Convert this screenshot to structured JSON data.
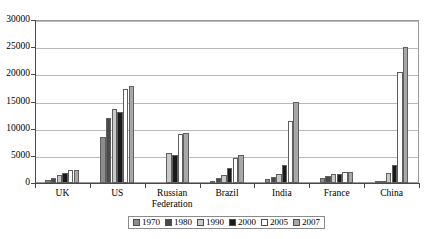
{
  "chart_data": {
    "type": "bar",
    "title": "",
    "subtitle": "",
    "xlabel": "",
    "ylabel": "",
    "ylim": [
      0,
      30000
    ],
    "ytick_step": 5000,
    "yticks": [
      "0",
      "5000",
      "10000",
      "15000",
      "20000",
      "25000",
      "30000"
    ],
    "grid": true,
    "legend_position": "bottom",
    "categories": [
      "UK",
      "US",
      "Russian Federation",
      "Brazil",
      "India",
      "France",
      "China"
    ],
    "series": [
      {
        "name": "1970",
        "color": "#8c8c8c",
        "values": [
          600,
          8500,
          null,
          400,
          700,
          900,
          300
        ]
      },
      {
        "name": "1980",
        "color": "#4a4a4a",
        "values": [
          950,
          12000,
          null,
          900,
          1100,
          1350,
          450
        ]
      },
      {
        "name": "1990",
        "color": "#c9c9c9",
        "values": [
          1450,
          13700,
          5500,
          1500,
          1750,
          1600,
          1900
        ]
      },
      {
        "name": "2000",
        "color": "#1a1a1a",
        "values": [
          1800,
          13000,
          5150,
          2700,
          3250,
          1750,
          3300
        ]
      },
      {
        "name": "2005",
        "color": "#ffffff",
        "values": [
          2350,
          17300,
          8950,
          4600,
          11500,
          2000,
          20500
        ]
      },
      {
        "name": "2007",
        "color": "#a8a8a8",
        "values": [
          2350,
          17800,
          9250,
          5100,
          14900,
          2050,
          25100
        ]
      }
    ]
  },
  "legend": {
    "items": [
      {
        "label": "1970"
      },
      {
        "label": "1980"
      },
      {
        "label": "1990"
      },
      {
        "label": "2000"
      },
      {
        "label": "2005"
      },
      {
        "label": "2007"
      }
    ]
  }
}
